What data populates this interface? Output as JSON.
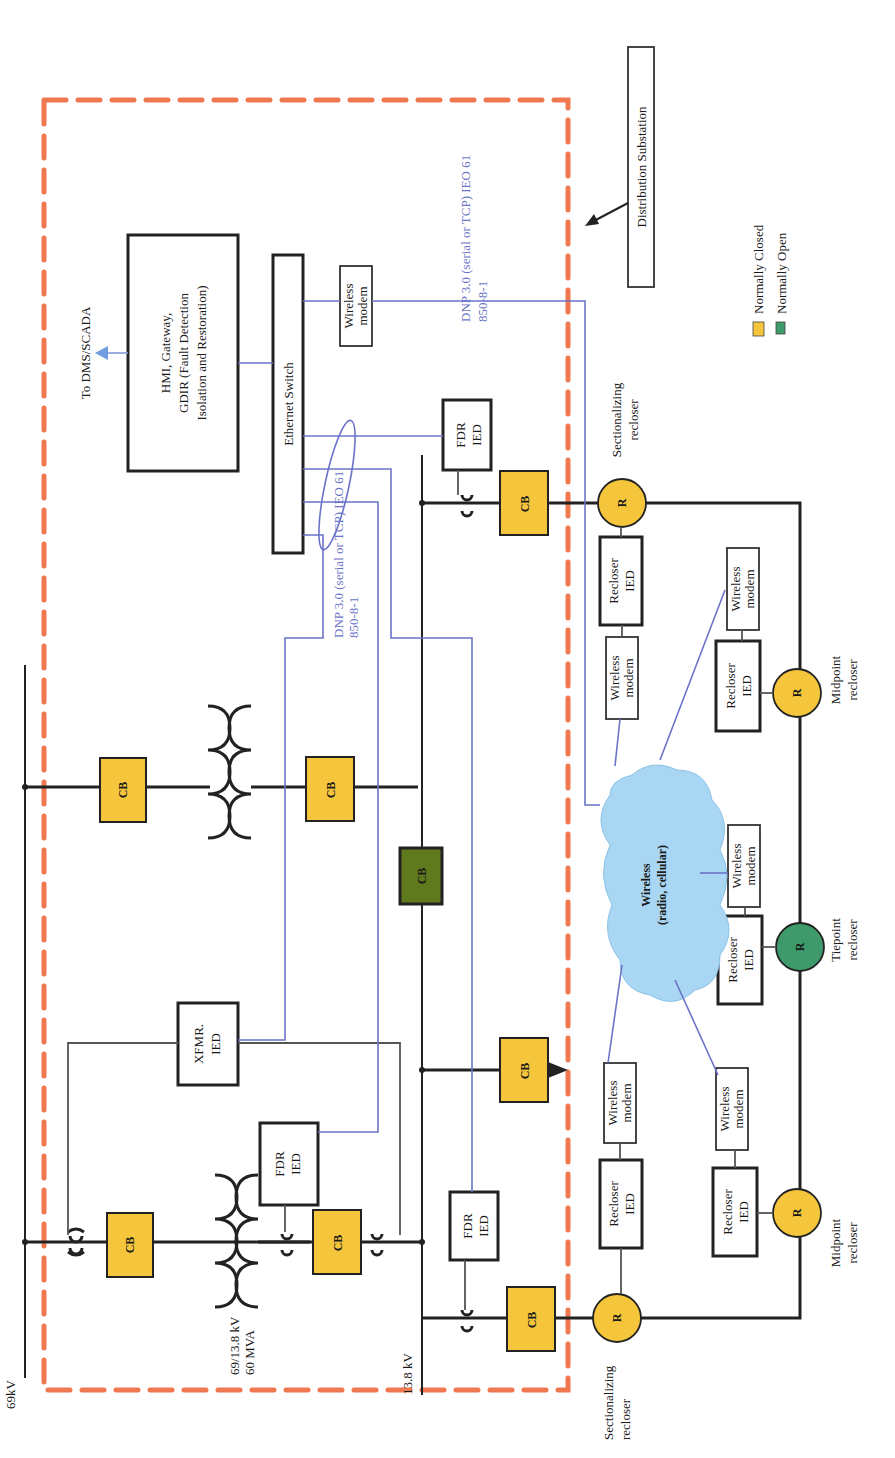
{
  "diagram": {
    "title": "Distribution Substation",
    "colors": {
      "normally_closed": "#f5c63c",
      "normally_open": "#3e9a6a",
      "tie_cb": "#5e7a1c",
      "comm_link": "#6b74c8",
      "substation_border": "#f07850",
      "cloud": "#a9d6f2"
    },
    "labels": {
      "bus_69kv": "69kV",
      "bus_13_8kv": "13.8 kV",
      "transformer_rating_1": "69/13.8 kV",
      "transformer_rating_2": "60 MVA",
      "to_dms": "To DMS/SCADA",
      "hmi_line1": "HMI, Gateway,",
      "hmi_line2": "GDIR (Fault Detection",
      "hmi_line3": "Isolation and Restoration)",
      "ethernet_switch": "Ethernet Switch",
      "protocol_1_line1": "DNP 3.0 (serial or TCP) IEO 61",
      "protocol_1_line2": "850-8-1",
      "protocol_2_line1": "DNP 3.0 (serial or TCP) IEO 61",
      "protocol_2_line2": "850-8-1",
      "distribution_substation": "Distribution Substation",
      "cloud_line1": "Wireless",
      "cloud_line2": "(radio, cellular)",
      "cb": "CB",
      "recloser_symbol": "R",
      "xfmr_ied_1": "XFMR.",
      "xfmr_ied_2": "IED",
      "fdr_ied_1": "FDR",
      "fdr_ied_2": "IED",
      "recloser_ied_1": "Recloser",
      "recloser_ied_2": "IED",
      "wireless_modem_1": "Wireless",
      "wireless_modem_2": "modem"
    },
    "reclosers": [
      {
        "id": "sect-left",
        "type_line1": "Sectionalizing",
        "type_line2": "recloser",
        "state": "normally_closed"
      },
      {
        "id": "mid-left",
        "type_line1": "Midpoint",
        "type_line2": "recloser",
        "state": "normally_closed"
      },
      {
        "id": "tie",
        "type_line1": "Tiepoint",
        "type_line2": "recloser",
        "state": "normally_open"
      },
      {
        "id": "mid-right",
        "type_line1": "Midpoint",
        "type_line2": "recloser",
        "state": "normally_closed"
      },
      {
        "id": "sect-right",
        "type_line1": "Sectionalizing",
        "type_line2": "recloser",
        "state": "normally_closed"
      }
    ],
    "legend": [
      {
        "label": "Normally Closed",
        "color": "#f5c63c"
      },
      {
        "label": "Normally Open",
        "color": "#3e9a6a"
      }
    ]
  }
}
